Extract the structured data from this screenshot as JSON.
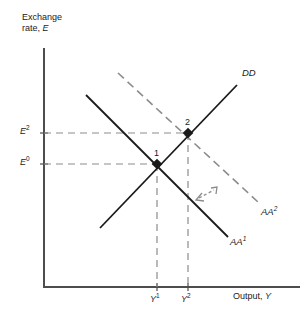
{
  "figure": {
    "type": "economics-diagram"
  },
  "axes": {
    "y_title_line1": "Exchange",
    "y_title_line2_prefix": "rate, ",
    "y_title_line2_var": "E",
    "x_title_prefix": "Output, ",
    "x_title_var": "Y",
    "color": "#4d4d4d"
  },
  "y_ticks": [
    {
      "base": "E",
      "sup": "2",
      "value_y": 133
    },
    {
      "base": "E",
      "sup": "0",
      "value_y": 164
    }
  ],
  "x_ticks": [
    {
      "base": "Y",
      "sup": "1",
      "value_x": 157
    },
    {
      "base": "Y",
      "sup": "2",
      "value_x": 188
    }
  ],
  "curves": [
    {
      "id": "DD",
      "base": "DD",
      "sup": "",
      "style": "solid",
      "color": "#1a1a1a",
      "x1": 100,
      "y1": 228,
      "x2": 237,
      "y2": 85
    },
    {
      "id": "AA1",
      "base": "AA",
      "sup": "1",
      "style": "solid",
      "color": "#1a1a1a",
      "x1": 86,
      "y1": 95,
      "x2": 228,
      "y2": 237
    },
    {
      "id": "AA2",
      "base": "AA",
      "sup": "2",
      "style": "dashed",
      "color": "#8c8c8c",
      "x1": 118,
      "y1": 73,
      "x2": 258,
      "y2": 202
    }
  ],
  "points": [
    {
      "label": "1",
      "x": 157,
      "y": 164
    },
    {
      "label": "2",
      "x": 188,
      "y": 133
    }
  ],
  "shift_arrow": {
    "name": "shift-arrow",
    "x1": 196,
    "y1": 200,
    "x2": 217,
    "y2": 188,
    "color": "#8c8c8c"
  },
  "chart_data": {
    "type": "line",
    "title": "",
    "xlabel": "Output, Y",
    "ylabel": "Exchange rate, E",
    "grid": false,
    "legend": "inline-curve-labels",
    "series": [
      {
        "name": "DD",
        "slope": "upward",
        "points": [
          [
            100,
            228
          ],
          [
            237,
            85
          ]
        ]
      },
      {
        "name": "AA1",
        "slope": "downward",
        "points": [
          [
            86,
            95
          ],
          [
            228,
            237
          ]
        ]
      },
      {
        "name": "AA2",
        "slope": "downward",
        "points": [
          [
            118,
            73
          ],
          [
            258,
            202
          ]
        ]
      }
    ],
    "equilibria": [
      {
        "label": "1",
        "x_tick": "Y1",
        "y_tick": "E0"
      },
      {
        "label": "2",
        "x_tick": "Y2",
        "y_tick": "E2"
      }
    ],
    "xtick_labels": [
      "Y1",
      "Y2"
    ],
    "ytick_labels": [
      "E0",
      "E2"
    ]
  }
}
